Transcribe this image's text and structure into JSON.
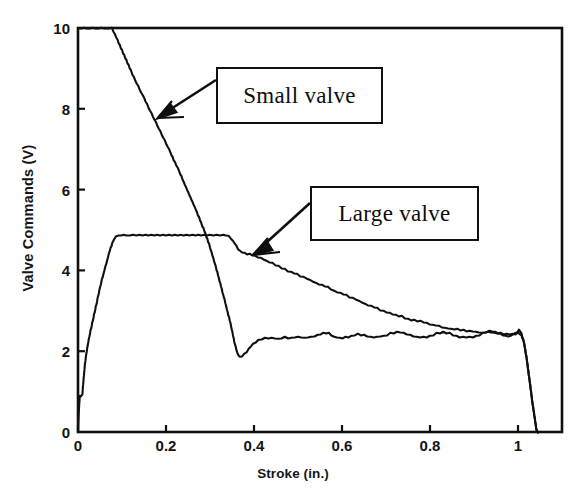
{
  "chart_data": {
    "type": "line",
    "title": "",
    "xlabel": "Stroke (in.)",
    "ylabel": "Valve Commands (V)",
    "xlim": [
      0,
      1.1
    ],
    "ylim": [
      0,
      10
    ],
    "xticks": [
      0,
      0.2,
      0.4,
      0.6,
      0.8,
      1
    ],
    "xticklabels": [
      "0",
      "0.2",
      "0.4",
      "0.6",
      "0.8",
      "1"
    ],
    "yticks": [
      0,
      2,
      4,
      6,
      8,
      10
    ],
    "yticklabels": [
      "0",
      "2",
      "4",
      "6",
      "8",
      "10"
    ],
    "grid": false,
    "legend_position": "annotation-boxes",
    "line_color": "#101010",
    "background_color": "#ffffff",
    "series": [
      {
        "name": "Small valve",
        "annotation_label": "Small valve",
        "description": "Starts at 10 V (clipped at top of axis), decreases steeply and nearly linearly to a minimum near 1.85 V at stroke 0.36 in., then settles into a noisy plateau around 2.3-2.5 V until stroke ~1.02 in., then drops sharply to 0 V.",
        "points": [
          [
            0.0,
            10.0
          ],
          [
            0.02,
            10.0
          ],
          [
            0.04,
            10.0
          ],
          [
            0.06,
            10.0
          ],
          [
            0.077,
            10.0
          ],
          [
            0.09,
            9.7
          ],
          [
            0.1,
            9.45
          ],
          [
            0.11,
            9.2
          ],
          [
            0.12,
            8.95
          ],
          [
            0.13,
            8.72
          ],
          [
            0.14,
            8.5
          ],
          [
            0.15,
            8.28
          ],
          [
            0.16,
            8.05
          ],
          [
            0.17,
            7.82
          ],
          [
            0.18,
            7.6
          ],
          [
            0.19,
            7.38
          ],
          [
            0.2,
            7.15
          ],
          [
            0.21,
            6.92
          ],
          [
            0.22,
            6.68
          ],
          [
            0.23,
            6.45
          ],
          [
            0.24,
            6.2
          ],
          [
            0.25,
            5.95
          ],
          [
            0.26,
            5.7
          ],
          [
            0.27,
            5.45
          ],
          [
            0.28,
            5.18
          ],
          [
            0.29,
            4.9
          ],
          [
            0.3,
            4.58
          ],
          [
            0.31,
            4.22
          ],
          [
            0.32,
            3.82
          ],
          [
            0.33,
            3.4
          ],
          [
            0.34,
            2.98
          ],
          [
            0.348,
            2.62
          ],
          [
            0.355,
            2.25
          ],
          [
            0.362,
            1.95
          ],
          [
            0.368,
            1.85
          ],
          [
            0.378,
            1.92
          ],
          [
            0.388,
            2.06
          ],
          [
            0.398,
            2.18
          ],
          [
            0.41,
            2.28
          ],
          [
            0.425,
            2.32
          ],
          [
            0.44,
            2.33
          ],
          [
            0.455,
            2.31
          ],
          [
            0.47,
            2.34
          ],
          [
            0.485,
            2.33
          ],
          [
            0.5,
            2.36
          ],
          [
            0.515,
            2.33
          ],
          [
            0.53,
            2.35
          ],
          [
            0.545,
            2.4
          ],
          [
            0.558,
            2.46
          ],
          [
            0.57,
            2.44
          ],
          [
            0.582,
            2.36
          ],
          [
            0.595,
            2.32
          ],
          [
            0.608,
            2.34
          ],
          [
            0.622,
            2.38
          ],
          [
            0.636,
            2.42
          ],
          [
            0.65,
            2.4
          ],
          [
            0.665,
            2.36
          ],
          [
            0.68,
            2.35
          ],
          [
            0.695,
            2.38
          ],
          [
            0.71,
            2.44
          ],
          [
            0.725,
            2.48
          ],
          [
            0.74,
            2.46
          ],
          [
            0.755,
            2.4
          ],
          [
            0.77,
            2.36
          ],
          [
            0.785,
            2.34
          ],
          [
            0.8,
            2.38
          ],
          [
            0.815,
            2.44
          ],
          [
            0.83,
            2.48
          ],
          [
            0.845,
            2.44
          ],
          [
            0.86,
            2.38
          ],
          [
            0.875,
            2.34
          ],
          [
            0.89,
            2.34
          ],
          [
            0.905,
            2.38
          ],
          [
            0.92,
            2.44
          ],
          [
            0.935,
            2.5
          ],
          [
            0.948,
            2.48
          ],
          [
            0.96,
            2.42
          ],
          [
            0.972,
            2.38
          ],
          [
            0.984,
            2.38
          ],
          [
            0.994,
            2.45
          ],
          [
            1.002,
            2.52
          ],
          [
            1.008,
            2.44
          ],
          [
            1.014,
            2.2
          ],
          [
            1.02,
            1.8
          ],
          [
            1.026,
            1.3
          ],
          [
            1.032,
            0.8
          ],
          [
            1.038,
            0.35
          ],
          [
            1.042,
            0.05
          ],
          [
            1.045,
            0.0
          ]
        ]
      },
      {
        "name": "Large valve",
        "annotation_label": "Large valve",
        "description": "Starts near 0.9 V at stroke 0, rises steeply to a flat plateau at about 4.88 V between stroke 0.08 and 0.345 in., then decays gradually with noise from 4.5 V down to about 2.4 V at stroke 1.0 in., then drops sharply to 0 V.",
        "points": [
          [
            0.0,
            0.0
          ],
          [
            0.002,
            0.55
          ],
          [
            0.004,
            0.88
          ],
          [
            0.006,
            0.9
          ],
          [
            0.01,
            0.95
          ],
          [
            0.013,
            1.35
          ],
          [
            0.016,
            1.7
          ],
          [
            0.019,
            1.95
          ],
          [
            0.022,
            2.15
          ],
          [
            0.026,
            2.38
          ],
          [
            0.03,
            2.58
          ],
          [
            0.034,
            2.78
          ],
          [
            0.038,
            2.98
          ],
          [
            0.042,
            3.18
          ],
          [
            0.046,
            3.38
          ],
          [
            0.05,
            3.58
          ],
          [
            0.054,
            3.76
          ],
          [
            0.058,
            3.92
          ],
          [
            0.062,
            4.08
          ],
          [
            0.066,
            4.24
          ],
          [
            0.07,
            4.4
          ],
          [
            0.074,
            4.55
          ],
          [
            0.078,
            4.68
          ],
          [
            0.082,
            4.78
          ],
          [
            0.086,
            4.85
          ],
          [
            0.092,
            4.88
          ],
          [
            0.11,
            4.88
          ],
          [
            0.14,
            4.88
          ],
          [
            0.18,
            4.88
          ],
          [
            0.22,
            4.88
          ],
          [
            0.26,
            4.88
          ],
          [
            0.3,
            4.88
          ],
          [
            0.33,
            4.88
          ],
          [
            0.342,
            4.86
          ],
          [
            0.352,
            4.74
          ],
          [
            0.36,
            4.6
          ],
          [
            0.368,
            4.48
          ],
          [
            0.378,
            4.42
          ],
          [
            0.39,
            4.4
          ],
          [
            0.402,
            4.36
          ],
          [
            0.415,
            4.3
          ],
          [
            0.428,
            4.24
          ],
          [
            0.442,
            4.18
          ],
          [
            0.456,
            4.1
          ],
          [
            0.47,
            4.03
          ],
          [
            0.484,
            3.96
          ],
          [
            0.498,
            3.9
          ],
          [
            0.512,
            3.84
          ],
          [
            0.526,
            3.76
          ],
          [
            0.54,
            3.7
          ],
          [
            0.554,
            3.64
          ],
          [
            0.568,
            3.58
          ],
          [
            0.582,
            3.5
          ],
          [
            0.596,
            3.44
          ],
          [
            0.61,
            3.38
          ],
          [
            0.624,
            3.32
          ],
          [
            0.638,
            3.24
          ],
          [
            0.652,
            3.18
          ],
          [
            0.666,
            3.12
          ],
          [
            0.68,
            3.06
          ],
          [
            0.694,
            3.0
          ],
          [
            0.708,
            2.94
          ],
          [
            0.722,
            2.9
          ],
          [
            0.736,
            2.86
          ],
          [
            0.75,
            2.8
          ],
          [
            0.764,
            2.76
          ],
          [
            0.778,
            2.74
          ],
          [
            0.792,
            2.7
          ],
          [
            0.806,
            2.66
          ],
          [
            0.82,
            2.62
          ],
          [
            0.834,
            2.58
          ],
          [
            0.848,
            2.56
          ],
          [
            0.862,
            2.54
          ],
          [
            0.876,
            2.52
          ],
          [
            0.89,
            2.5
          ],
          [
            0.904,
            2.48
          ],
          [
            0.918,
            2.46
          ],
          [
            0.932,
            2.48
          ],
          [
            0.946,
            2.46
          ],
          [
            0.96,
            2.44
          ],
          [
            0.974,
            2.42
          ],
          [
            0.988,
            2.42
          ],
          [
            1.0,
            2.44
          ],
          [
            1.008,
            2.4
          ],
          [
            1.014,
            2.2
          ],
          [
            1.02,
            1.8
          ],
          [
            1.026,
            1.3
          ],
          [
            1.032,
            0.8
          ],
          [
            1.038,
            0.35
          ],
          [
            1.042,
            0.05
          ],
          [
            1.045,
            0.0
          ]
        ]
      }
    ],
    "annotations": [
      {
        "label": "Small valve",
        "points_to_series": "Small valve"
      },
      {
        "label": "Large valve",
        "points_to_series": "Large valve"
      }
    ]
  },
  "axes": {
    "x_title": "Stroke (in.)",
    "y_title": "Valve Commands (V)",
    "x_ticks": [
      "0",
      "0.2",
      "0.4",
      "0.6",
      "0.8",
      "1"
    ],
    "y_ticks": [
      "10",
      "8",
      "6",
      "4",
      "2",
      "0"
    ]
  },
  "annotations": {
    "small_valve": "Small valve",
    "large_valve": "Large valve"
  }
}
